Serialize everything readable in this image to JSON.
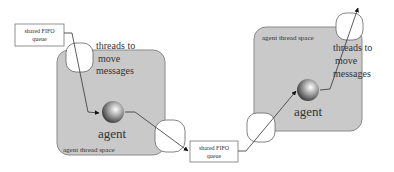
{
  "diagram": {
    "colors": {
      "thread_space_fill": "#c9c9c9",
      "thread_space_stroke": "#8a8a8a",
      "line": "#333333",
      "box_stroke": "#777777"
    },
    "left_agent": {
      "thread_space_label": "agent thread space",
      "agent_label": "agent",
      "threads_label_lines": [
        "threads to",
        "move",
        "messages"
      ]
    },
    "right_agent": {
      "thread_space_label": "agent thread space",
      "agent_label": "agent",
      "threads_label_lines": [
        "threads to",
        "move",
        "messages"
      ]
    },
    "queues": [
      {
        "id": "top-left",
        "lines": [
          "shared FIFO",
          "queue"
        ]
      },
      {
        "id": "middle",
        "lines": [
          "shared FIFO",
          "queue"
        ]
      }
    ]
  }
}
